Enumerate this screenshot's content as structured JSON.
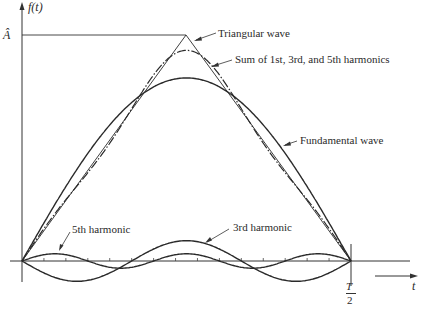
{
  "diagram": {
    "type": "Fourier series approximation of triangular wave",
    "labels": {
      "y_axis": "f(t)",
      "amplitude": "Â",
      "x_axis": "t",
      "half_period_num": "T",
      "half_period_den": "2",
      "triangular": "Triangular wave",
      "sum": "Sum of 1st, 3rd, and 5th harmonics",
      "fundamental": "Fundamental wave",
      "third": "3rd harmonic",
      "fifth": "5th harmonic"
    },
    "curves": [
      {
        "name": "Triangular wave",
        "style": "thin solid",
        "peak_fraction": 1.0
      },
      {
        "name": "Sum of 1st, 3rd, and 5th harmonics",
        "style": "dash-dot",
        "peak_fraction": 0.93
      },
      {
        "name": "Fundamental wave",
        "style": "solid",
        "peak_fraction": 0.81
      },
      {
        "name": "3rd harmonic",
        "style": "solid",
        "peak_fraction": 0.09
      },
      {
        "name": "5th harmonic",
        "style": "solid",
        "peak_fraction": 0.032
      }
    ],
    "ticks_between_0_and_T_over_2": 15
  },
  "colors": {
    "ink": "#2a2a2a",
    "background": "#ffffff"
  }
}
